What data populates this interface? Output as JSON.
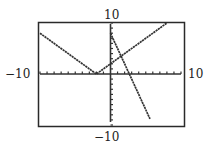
{
  "chart_data": {
    "type": "line",
    "title": "",
    "xlabel": "",
    "ylabel": "",
    "xlim": [
      -10,
      10
    ],
    "ylim": [
      -10,
      10
    ],
    "xscl": 1,
    "yscl": 1,
    "grid": false,
    "window_labels": {
      "xmin": "−10",
      "xmax": "10",
      "ymin": "−10",
      "ymax": "10"
    },
    "series": [
      {
        "name": "y = |x + 2|",
        "points": [
          [
            -10,
            8
          ],
          [
            -2,
            0
          ],
          [
            8,
            10
          ]
        ]
      },
      {
        "name": "y = -3x + 8",
        "points": [
          [
            0,
            8
          ],
          [
            5.6,
            -8.8
          ]
        ]
      }
    ],
    "colors": {
      "frame": "#2a2a2a",
      "plot": "#333333"
    }
  }
}
